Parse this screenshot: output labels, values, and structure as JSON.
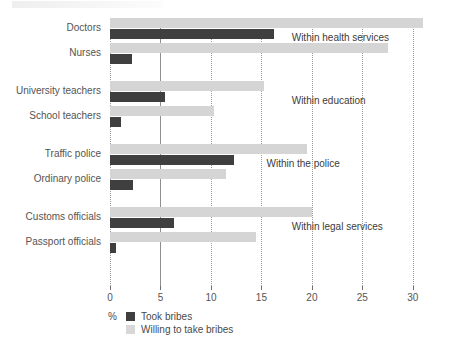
{
  "chart_data": {
    "type": "bar",
    "orientation": "horizontal",
    "title": "",
    "xlabel": "%",
    "ylabel": "",
    "xlim": [
      0,
      31.5
    ],
    "xticks": [
      0,
      5,
      10,
      15,
      20,
      25,
      30
    ],
    "xticklabels": [
      "0",
      "5",
      "10",
      "15",
      "20",
      "25",
      "30"
    ],
    "grid": true,
    "grid_axis": "x",
    "legend_position": "bottom-left",
    "categories": [
      "Doctors",
      "Nurses",
      "University teachers",
      "School teachers",
      "Traffic police",
      "Ordinary police",
      "Customs officials",
      "Passport officials"
    ],
    "series": [
      {
        "name": "Took bribes",
        "color": "#3f3f3f",
        "values": [
          16.2,
          2.2,
          5.4,
          1.1,
          12.3,
          2.3,
          6.3,
          0.6
        ]
      },
      {
        "name": "Willing to take bribes",
        "color": "#d5d5d5",
        "values": [
          31.0,
          27.5,
          15.3,
          10.3,
          19.5,
          11.5,
          20.0,
          14.5
        ]
      }
    ],
    "annotations": [
      {
        "text": "Within health services",
        "group": [
          "Doctors",
          "Nurses"
        ]
      },
      {
        "text": "Within education",
        "group": [
          "University teachers",
          "School teachers"
        ]
      },
      {
        "text": "Within the police",
        "group": [
          "Traffic police",
          "Ordinary police"
        ]
      },
      {
        "text": "Within legal services",
        "group": [
          "Customs officials",
          "Passport officials"
        ]
      }
    ]
  },
  "legend": {
    "percent_symbol": "%",
    "entries": [
      {
        "label": "Took bribes",
        "color": "#3f3f3f"
      },
      {
        "label": "Willing to take bribes",
        "color": "#d5d5d5"
      }
    ]
  }
}
